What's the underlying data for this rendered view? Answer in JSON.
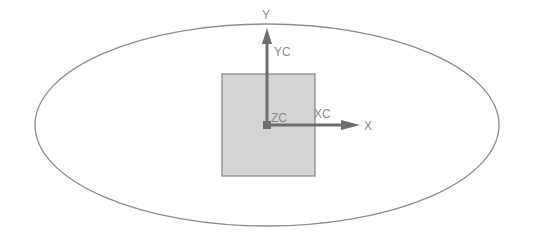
{
  "diagram": {
    "type": "coordinate-system",
    "colors": {
      "background": "#ffffff",
      "ellipse_stroke": "#8c8c8c",
      "square_fill": "#d4d4d4",
      "square_stroke": "#8c8c8c",
      "axis": "#6e6e6e",
      "label": "#8a8a8a"
    },
    "labels": {
      "y_absolute": "Y",
      "y_work": "YC",
      "z_work": "ZC",
      "x_work": "XC",
      "x_absolute": "X"
    }
  }
}
